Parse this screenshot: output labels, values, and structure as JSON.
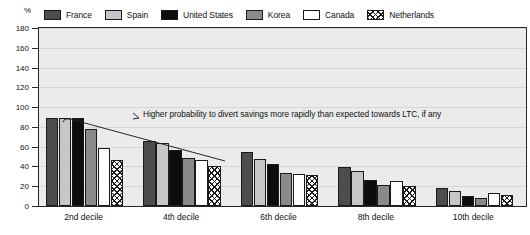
{
  "axis": {
    "unit_label": "%",
    "y_ticks": [
      0,
      20,
      40,
      60,
      80,
      100,
      120,
      140,
      160,
      180
    ],
    "y_min": 0,
    "y_max": 180
  },
  "legend": {
    "items": [
      {
        "label": "France",
        "swatch": "dark-gray-solid",
        "color": "#4d4d4d"
      },
      {
        "label": "Spain",
        "swatch": "light-gray-solid",
        "color": "#c6c6c6"
      },
      {
        "label": "United States",
        "swatch": "black-solid",
        "color": "#0d0d0d"
      },
      {
        "label": "Korea",
        "swatch": "medium-gray-solid",
        "color": "#8a8a8a"
      },
      {
        "label": "Canada",
        "swatch": "white-solid",
        "color": "#fdfdfd"
      },
      {
        "label": "Netherlands",
        "swatch": "cross-hatch",
        "color": "#ffffff"
      }
    ]
  },
  "annotation": {
    "text": "Higher probability to divert savings more rapidly than expected towards LTC, if any"
  },
  "chart_data": {
    "type": "bar",
    "title": "",
    "xlabel": "",
    "ylabel": "%",
    "ylim": [
      0,
      180
    ],
    "grid": true,
    "legend_position": "top",
    "categories": [
      "2nd decile",
      "4th decile",
      "6th decile",
      "8th decile",
      "10th decile"
    ],
    "series": [
      {
        "name": "France",
        "values": [
          89,
          66,
          55,
          39,
          18
        ]
      },
      {
        "name": "Spain",
        "values": [
          89,
          64,
          48,
          35,
          15
        ]
      },
      {
        "name": "United States",
        "values": [
          89,
          57,
          42,
          26,
          10
        ]
      },
      {
        "name": "Korea",
        "values": [
          78,
          49,
          33,
          21,
          8
        ]
      },
      {
        "name": "Canada",
        "values": [
          59,
          47,
          32,
          25,
          13
        ]
      },
      {
        "name": "Netherlands",
        "values": [
          47,
          40,
          31,
          20,
          11
        ]
      }
    ]
  }
}
